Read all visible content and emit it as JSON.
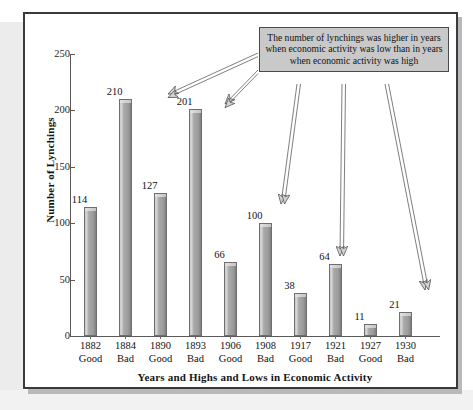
{
  "figure": {
    "callout_text": "The number of lynchings was higher in years when economic activity was low than in years when economic activity was high"
  },
  "chart_data": {
    "type": "bar",
    "title": "",
    "xlabel": "Years and Highs and Lows in Economic Activity",
    "ylabel": "Number of Lynchings",
    "ylim": [
      0,
      250
    ],
    "yticks": [
      "0",
      "50",
      "100",
      "150",
      "200",
      "250"
    ],
    "grid": false,
    "legend": "none",
    "categories": [
      "1882\nGood",
      "1884\nBad",
      "1890\nGood",
      "1893\nBad",
      "1906\nGood",
      "1908\nBad",
      "1917\nGood",
      "1921\nBad",
      "1927\nGood",
      "1930\nBad"
    ],
    "bars": [
      {
        "year": "1882",
        "economy": "Good",
        "value": 114,
        "label": "114"
      },
      {
        "year": "1884",
        "economy": "Bad",
        "value": 210,
        "label": "210"
      },
      {
        "year": "1890",
        "economy": "Good",
        "value": 127,
        "label": "127"
      },
      {
        "year": "1893",
        "economy": "Bad",
        "value": 201,
        "label": "201"
      },
      {
        "year": "1906",
        "economy": "Good",
        "value": 66,
        "label": "66"
      },
      {
        "year": "1908",
        "economy": "Bad",
        "value": 100,
        "label": "100"
      },
      {
        "year": "1917",
        "economy": "Good",
        "value": 38,
        "label": "38"
      },
      {
        "year": "1921",
        "economy": "Bad",
        "value": 64,
        "label": "64"
      },
      {
        "year": "1927",
        "economy": "Good",
        "value": 11,
        "label": "11"
      },
      {
        "year": "1930",
        "economy": "Bad",
        "value": 21,
        "label": "21"
      }
    ],
    "values": [
      114,
      210,
      127,
      201,
      66,
      100,
      38,
      64,
      11,
      21
    ],
    "annotations": [
      {
        "text": "The number of lynchings was higher in years when economic activity was low than in years when economic activity was high",
        "points_to": [
          "1884",
          "1893",
          "1908",
          "1921",
          "1930"
        ]
      }
    ],
    "colors": {
      "bar_fill": "#a6a6a6",
      "bar_edge": "#6e6e70",
      "callout_fill": "#c9c9c9",
      "frame": "#3a3a3c",
      "axis": "#5a5a5c"
    }
  }
}
